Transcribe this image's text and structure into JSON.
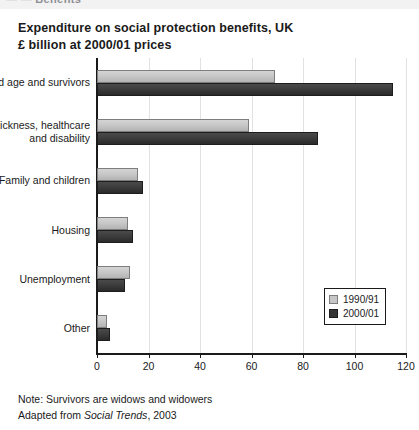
{
  "top_strip": {
    "fragment_dim": "— —",
    "fragment": "Benefits"
  },
  "title": {
    "line1": "Expenditure on social protection benefits, UK",
    "line2": "£ billion at 2000/01 prices"
  },
  "footer": {
    "note": "Note: Survivors are widows and widowers",
    "source_prefix": "Adapted from ",
    "source_italic": "Social Trends",
    "source_suffix": ", 2003"
  },
  "legend": {
    "position": "bottom-right",
    "items": [
      {
        "label": "1990/91",
        "color": "#c6c6c6"
      },
      {
        "label": "2000/01",
        "color": "#353535"
      }
    ]
  },
  "chart_data": {
    "type": "bar",
    "orientation": "horizontal",
    "title": "Expenditure on social protection benefits, UK",
    "subtitle": "£ billion at 2000/01 prices",
    "xlabel": "",
    "ylabel": "",
    "xlim": [
      0,
      120
    ],
    "xticks": [
      0,
      20,
      40,
      60,
      80,
      100,
      120
    ],
    "xticklabels": [
      "0",
      "20",
      "40",
      "60",
      "80",
      "100",
      "120"
    ],
    "grid": "vertical",
    "categories": [
      "Old age and survivors",
      "Sickness, healthcare and disability",
      "Family and children",
      "Housing",
      "Unemployment",
      "Other"
    ],
    "category_label_lines": [
      [
        "Old age and survivors"
      ],
      [
        "Sickness, healthcare",
        "and disability"
      ],
      [
        "Family and children"
      ],
      [
        "Housing"
      ],
      [
        "Unemployment"
      ],
      [
        "Other"
      ]
    ],
    "series": [
      {
        "name": "1990/91",
        "color": "#c6c6c6",
        "values": [
          69,
          59,
          16,
          12,
          13,
          4
        ]
      },
      {
        "name": "2000/01",
        "color": "#353535",
        "values": [
          115,
          86,
          18,
          14,
          11,
          5
        ]
      }
    ]
  }
}
